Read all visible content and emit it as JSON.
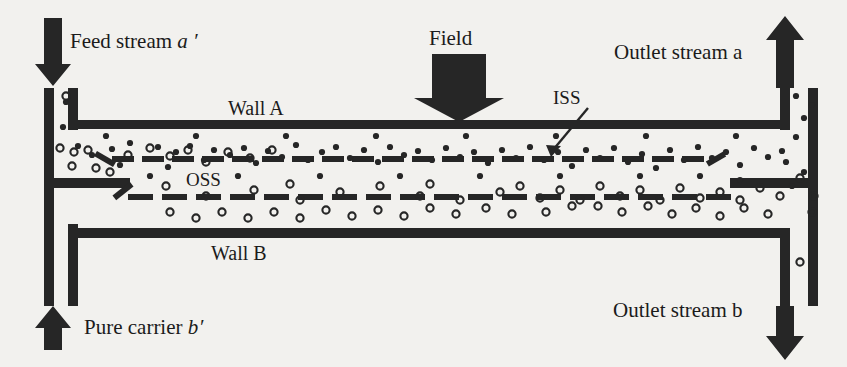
{
  "figure": {
    "kind": "ffff-channel-schematic",
    "background_color": "#f2f1ee",
    "ink_color": "#262626"
  },
  "labels": {
    "feed_stream": "Feed stream",
    "feed_stream_symbol": "a ′",
    "pure_carrier": "Pure carrier",
    "pure_carrier_symbol": "b′",
    "outlet_stream_a": "Outlet stream",
    "outlet_stream_a_symbol": "a",
    "outlet_stream_b": "Outlet stream",
    "outlet_stream_b_symbol": "b",
    "field": "Field",
    "wall_a": "Wall A",
    "wall_b": "Wall B",
    "iss": "ISS",
    "oss": "OSS"
  },
  "geometry": {
    "wall_a_y": 124,
    "wall_b_y": 233,
    "channel_left_x": 68,
    "channel_right_x": 790,
    "wall_thickness": 9,
    "iss_line_y": 156,
    "oss_line_y": 194
  },
  "chart_data": {
    "type": "diagram",
    "streams": [
      {
        "name": "Feed stream a'",
        "direction": "down",
        "position": "top-left",
        "arrow": "↓"
      },
      {
        "name": "Pure carrier b'",
        "direction": "up",
        "position": "bottom-left",
        "arrow": "↑"
      },
      {
        "name": "Outlet stream a",
        "direction": "up",
        "position": "top-right",
        "arrow": "↑"
      },
      {
        "name": "Outlet stream b",
        "direction": "down",
        "position": "bottom-right",
        "arrow": "↓"
      },
      {
        "name": "Field",
        "direction": "down",
        "position": "top-center",
        "arrow": "↓"
      }
    ],
    "surfaces": [
      {
        "name": "ISS",
        "full_name": "Inlet splitting surface",
        "style": "dashed",
        "y": 156
      },
      {
        "name": "OSS",
        "full_name": "Outlet splitting surface",
        "style": "dashed",
        "y": 194
      }
    ],
    "walls": [
      {
        "name": "Wall A",
        "position": "top",
        "y": 124
      },
      {
        "name": "Wall B",
        "position": "bottom",
        "y": 233
      }
    ],
    "particle_species": [
      {
        "name": "small-retained",
        "marker": "filled-dot",
        "color": "#262626",
        "distribution": "compressed near Wall A / above ISS, exits via outlet stream a"
      },
      {
        "name": "large-settling",
        "marker": "open-circle",
        "color": "#262626",
        "distribution": "settles toward Wall B / below OSS, exits via outlet stream b"
      }
    ]
  },
  "particles": {
    "filled": [
      [
        66,
        102
      ],
      [
        63,
        127
      ],
      [
        78,
        146
      ],
      [
        92,
        155
      ],
      [
        112,
        149
      ],
      [
        120,
        165
      ],
      [
        130,
        143
      ],
      [
        148,
        159
      ],
      [
        158,
        147
      ],
      [
        176,
        152
      ],
      [
        168,
        167
      ],
      [
        190,
        146
      ],
      [
        204,
        160
      ],
      [
        214,
        150
      ],
      [
        230,
        155
      ],
      [
        244,
        148
      ],
      [
        256,
        163
      ],
      [
        268,
        151
      ],
      [
        282,
        157
      ],
      [
        296,
        145
      ],
      [
        308,
        160
      ],
      [
        322,
        152
      ],
      [
        336,
        147
      ],
      [
        350,
        158
      ],
      [
        364,
        150
      ],
      [
        378,
        162
      ],
      [
        390,
        147
      ],
      [
        404,
        155
      ],
      [
        418,
        151
      ],
      [
        432,
        160
      ],
      [
        446,
        148
      ],
      [
        460,
        157
      ],
      [
        474,
        152
      ],
      [
        488,
        163
      ],
      [
        502,
        150
      ],
      [
        516,
        158
      ],
      [
        530,
        147
      ],
      [
        544,
        160
      ],
      [
        558,
        152
      ],
      [
        572,
        166
      ],
      [
        586,
        150
      ],
      [
        600,
        158
      ],
      [
        614,
        148
      ],
      [
        628,
        162
      ],
      [
        642,
        154
      ],
      [
        656,
        168
      ],
      [
        670,
        150
      ],
      [
        684,
        160
      ],
      [
        698,
        147
      ],
      [
        712,
        158
      ],
      [
        726,
        152
      ],
      [
        740,
        165
      ],
      [
        754,
        148
      ],
      [
        768,
        157
      ],
      [
        782,
        151
      ],
      [
        796,
        96
      ],
      [
        804,
        118
      ],
      [
        796,
        137
      ],
      [
        812,
        105
      ],
      [
        786,
        162
      ],
      [
        804,
        172
      ],
      [
        792,
        186
      ],
      [
        150,
        176
      ],
      [
        238,
        176
      ],
      [
        320,
        176
      ],
      [
        400,
        176
      ],
      [
        480,
        176
      ],
      [
        560,
        176
      ],
      [
        640,
        176
      ],
      [
        700,
        176
      ],
      [
        740,
        180
      ],
      [
        106,
        136
      ],
      [
        196,
        136
      ],
      [
        286,
        136
      ],
      [
        376,
        136
      ],
      [
        466,
        136
      ],
      [
        556,
        136
      ],
      [
        646,
        136
      ],
      [
        736,
        136
      ]
    ],
    "open": [
      [
        66,
        96
      ],
      [
        60,
        148
      ],
      [
        74,
        152
      ],
      [
        88,
        150
      ],
      [
        72,
        166
      ],
      [
        96,
        168
      ],
      [
        110,
        172
      ],
      [
        128,
        155
      ],
      [
        150,
        148
      ],
      [
        170,
        156
      ],
      [
        188,
        150
      ],
      [
        206,
        162
      ],
      [
        228,
        152
      ],
      [
        250,
        158
      ],
      [
        272,
        150
      ],
      [
        166,
        186
      ],
      [
        206,
        196
      ],
      [
        254,
        190
      ],
      [
        300,
        200
      ],
      [
        290,
        184
      ],
      [
        340,
        192
      ],
      [
        380,
        186
      ],
      [
        420,
        196
      ],
      [
        430,
        184
      ],
      [
        460,
        200
      ],
      [
        500,
        192
      ],
      [
        520,
        186
      ],
      [
        540,
        198
      ],
      [
        560,
        190
      ],
      [
        580,
        200
      ],
      [
        600,
        186
      ],
      [
        620,
        196
      ],
      [
        640,
        190
      ],
      [
        660,
        200
      ],
      [
        680,
        188
      ],
      [
        700,
        198
      ],
      [
        720,
        192
      ],
      [
        740,
        200
      ],
      [
        760,
        188
      ],
      [
        780,
        196
      ],
      [
        800,
        178
      ],
      [
        814,
        196
      ],
      [
        812,
        212
      ],
      [
        800,
        262
      ],
      [
        598,
        206
      ],
      [
        622,
        212
      ],
      [
        648,
        206
      ],
      [
        672,
        214
      ],
      [
        696,
        208
      ],
      [
        720,
        216
      ],
      [
        744,
        208
      ],
      [
        768,
        214
      ],
      [
        546,
        212
      ],
      [
        572,
        206
      ],
      [
        512,
        214
      ],
      [
        486,
        208
      ],
      [
        456,
        214
      ],
      [
        430,
        208
      ],
      [
        404,
        216
      ],
      [
        378,
        210
      ],
      [
        352,
        216
      ],
      [
        326,
        210
      ],
      [
        300,
        218
      ],
      [
        274,
        212
      ],
      [
        248,
        218
      ],
      [
        222,
        212
      ],
      [
        196,
        218
      ],
      [
        170,
        212
      ]
    ]
  },
  "iss_dashes": [
    [
      112,
      156
    ],
    [
      142,
      156
    ],
    [
      172,
      156
    ],
    [
      202,
      156
    ],
    [
      232,
      156
    ],
    [
      262,
      156
    ],
    [
      292,
      156
    ],
    [
      322,
      156
    ],
    [
      352,
      156
    ],
    [
      382,
      156
    ],
    [
      412,
      156
    ],
    [
      442,
      156
    ],
    [
      472,
      156
    ],
    [
      502,
      156
    ],
    [
      532,
      156
    ],
    [
      562,
      156
    ],
    [
      592,
      156
    ],
    [
      622,
      156
    ],
    [
      652,
      156
    ],
    [
      682,
      156
    ]
  ],
  "oss_dashes": [
    [
      128,
      194
    ],
    [
      162,
      194
    ],
    [
      196,
      194
    ],
    [
      230,
      194
    ],
    [
      264,
      194
    ],
    [
      298,
      194
    ],
    [
      332,
      194
    ],
    [
      366,
      194
    ],
    [
      400,
      194
    ],
    [
      434,
      194
    ],
    [
      468,
      194
    ],
    [
      502,
      194
    ],
    [
      536,
      194
    ],
    [
      570,
      194
    ],
    [
      604,
      194
    ],
    [
      638,
      194
    ],
    [
      672,
      194
    ],
    [
      706,
      194
    ]
  ]
}
